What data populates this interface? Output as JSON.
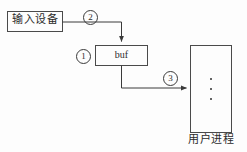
{
  "figure": {
    "width": 247,
    "height": 152,
    "background_color": "#fdfdfd",
    "stroke_color": "#4a4a4a",
    "text_color": "#2b2b2b"
  },
  "nodes": {
    "input_device": {
      "label": "输入设备",
      "shape": "rectangle",
      "x": 7,
      "y": 11,
      "width": 56,
      "height": 21
    },
    "buffer": {
      "label": "buf",
      "shape": "rectangle",
      "x": 95,
      "y": 45,
      "width": 53,
      "height": 21
    },
    "user_process": {
      "label": "用户进程",
      "shape": "rectangle",
      "x": 190,
      "y": 45,
      "width": 42,
      "height": 88,
      "contents": "⋮"
    }
  },
  "steps": [
    {
      "id": "step-1",
      "label": "①",
      "number": "1",
      "describes": "buffer"
    },
    {
      "id": "step-2",
      "label": "②",
      "number": "2",
      "describes": "input-device-to-buffer"
    },
    {
      "id": "step-3",
      "label": "③",
      "number": "3",
      "describes": "buffer-to-user-process"
    }
  ],
  "connectors": [
    {
      "name": "input-device-to-buffer",
      "from": "input_device",
      "to": "buffer",
      "marker": "②",
      "arrowhead": "end"
    },
    {
      "name": "buffer-to-user-process",
      "from": "buffer",
      "to": "user_process",
      "marker": "③",
      "arrowhead": "end"
    }
  ]
}
